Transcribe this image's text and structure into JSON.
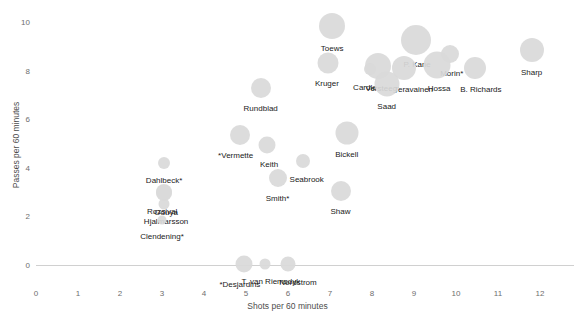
{
  "chart_data": {
    "type": "scatter",
    "title": "",
    "xlabel": "Shots per 60 minutes",
    "ylabel": "Passes per 60 minutes",
    "xlim": [
      0,
      12.5
    ],
    "ylim": [
      -0.6,
      10.6
    ],
    "xticks": [
      0,
      1,
      2,
      3,
      4,
      5,
      6,
      7,
      8,
      9,
      10,
      11,
      12
    ],
    "xtick_labels": [
      "0",
      "1",
      "2",
      "3",
      "4",
      "5",
      "6",
      "7",
      "8",
      "9",
      "10",
      "11",
      "12"
    ],
    "yticks": [
      0,
      2,
      4,
      6,
      8,
      10
    ],
    "ytick_labels": [
      "0",
      "2",
      "4",
      "6",
      "8",
      "10"
    ],
    "grid": false,
    "marker_color": "#d9d9d9",
    "label_color": "#1a1a1a",
    "axis_color": "#6e6e6e",
    "points": [
      {
        "name": "Toews",
        "x": 7.05,
        "y": 9.85,
        "size": 26,
        "label_dx": 0,
        "label_dy": 18
      },
      {
        "name": "P. Kane",
        "x": 9.05,
        "y": 9.25,
        "size": 30,
        "label_dx": 1,
        "label_dy": 20
      },
      {
        "name": "Morin*",
        "x": 9.85,
        "y": 8.7,
        "size": 18,
        "label_dx": 2,
        "label_dy": 15
      },
      {
        "name": "Sharp",
        "x": 11.8,
        "y": 8.85,
        "size": 24,
        "label_dx": 0,
        "label_dy": 18
      },
      {
        "name": "Kruger",
        "x": 6.95,
        "y": 8.3,
        "size": 21,
        "label_dx": -1,
        "label_dy": 16
      },
      {
        "name": "Versteeg",
        "x": 8.15,
        "y": 8.2,
        "size": 26,
        "label_dx": 3,
        "label_dy": 18
      },
      {
        "name": "Teravainen",
        "x": 8.75,
        "y": 8.1,
        "size": 24,
        "label_dx": 10,
        "label_dy": 17
      },
      {
        "name": "Hossa",
        "x": 9.55,
        "y": 8.25,
        "size": 27,
        "label_dx": 2,
        "label_dy": 19
      },
      {
        "name": "B. Richards",
        "x": 10.45,
        "y": 8.1,
        "size": 22,
        "label_dx": 6,
        "label_dy": 17
      },
      {
        "name": "Cardle",
        "x": 7.95,
        "y": 8.05,
        "size": 12,
        "label_dx": -5,
        "label_dy": 14
      },
      {
        "name": "Saad",
        "x": 8.35,
        "y": 7.45,
        "size": 25,
        "label_dx": 0,
        "label_dy": 18
      },
      {
        "name": "Rundblad",
        "x": 5.35,
        "y": 7.3,
        "size": 20,
        "label_dx": 0,
        "label_dy": 16
      },
      {
        "name": "Bickell",
        "x": 7.4,
        "y": 5.45,
        "size": 23,
        "label_dx": 0,
        "label_dy": 17
      },
      {
        "name": "*Vermette",
        "x": 4.85,
        "y": 5.35,
        "size": 20,
        "label_dx": -4,
        "label_dy": 16
      },
      {
        "name": "Keith",
        "x": 5.5,
        "y": 4.95,
        "size": 17,
        "label_dx": 2,
        "label_dy": 15
      },
      {
        "name": "Seabrook",
        "x": 6.35,
        "y": 4.3,
        "size": 14,
        "label_dx": 4,
        "label_dy": 14
      },
      {
        "name": "Dahlbeck*",
        "x": 3.05,
        "y": 4.2,
        "size": 12,
        "label_dx": 0,
        "label_dy": 13
      },
      {
        "name": "Smith*",
        "x": 5.75,
        "y": 3.6,
        "size": 18,
        "label_dx": 0,
        "label_dy": 16
      },
      {
        "name": "Shaw",
        "x": 7.25,
        "y": 3.05,
        "size": 20,
        "label_dx": 0,
        "label_dy": 16
      },
      {
        "name": "Rozsival",
        "x": 3.05,
        "y": 3.0,
        "size": 16,
        "label_dx": -2,
        "label_dy": 15
      },
      {
        "name": "Oduya",
        "x": 3.05,
        "y": 2.95,
        "size": 16,
        "label_dx": 2,
        "label_dy": 15
      },
      {
        "name": "Hjalmarsson",
        "x": 3.05,
        "y": 2.5,
        "size": 11,
        "label_dx": 2,
        "label_dy": 13
      },
      {
        "name": "Clendening*",
        "x": 3.0,
        "y": 1.85,
        "size": 9,
        "label_dx": 0,
        "label_dy": 12
      },
      {
        "name": "*Desjardins",
        "x": 4.95,
        "y": 0.05,
        "size": 17,
        "label_dx": -4,
        "label_dy": 16
      },
      {
        "name": "T. van Riemsdyk",
        "x": 5.45,
        "y": 0.05,
        "size": 11,
        "label_dx": 6,
        "label_dy": 13
      },
      {
        "name": "Nordstrom",
        "x": 6.0,
        "y": 0.05,
        "size": 15,
        "label_dx": 10,
        "label_dy": 14
      }
    ]
  }
}
